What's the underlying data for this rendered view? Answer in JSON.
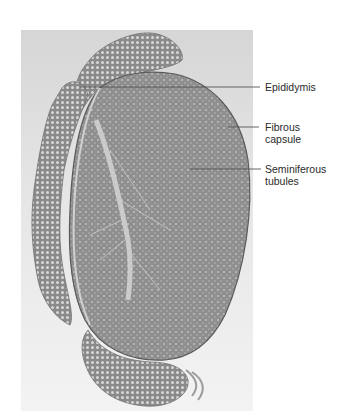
{
  "figure": {
    "labels": [
      {
        "id": "epididymis",
        "text": "Epididymis",
        "x": 265,
        "y": 81,
        "line": {
          "x1": 80,
          "y1": 87,
          "x2": 260,
          "y2": 87
        }
      },
      {
        "id": "fibrous-capsule",
        "text": "Fibrous\ncapsule",
        "x": 265,
        "y": 121,
        "line": {
          "x1": 228,
          "y1": 127,
          "x2": 259,
          "y2": 127
        }
      },
      {
        "id": "seminiferous-tubules",
        "text": "Seminiferous\ntubules",
        "x": 265,
        "y": 163,
        "line": {
          "x1": 190,
          "y1": 169,
          "x2": 261,
          "y2": 169
        }
      }
    ],
    "colors": {
      "background_top": "#d6d6d6",
      "background_bottom": "#f2f2f2",
      "tissue": "#8c8c8c",
      "epididymis": "#9a9a9a",
      "leader_line": "#555555",
      "label_text": "#2a2a2a"
    }
  }
}
